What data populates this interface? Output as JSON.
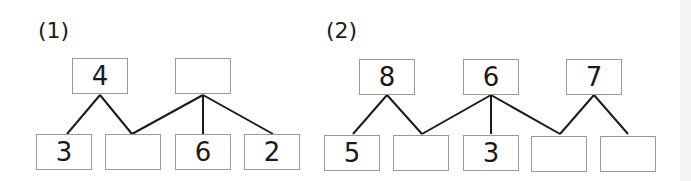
{
  "problems": [
    {
      "label": "(1)",
      "top": [
        "4",
        ""
      ],
      "bottom": [
        "3",
        "",
        "6",
        "2"
      ]
    },
    {
      "label": "(2)",
      "top": [
        "8",
        "6",
        "7"
      ],
      "bottom": [
        "5",
        "",
        "3",
        "",
        ""
      ]
    }
  ],
  "colors": {
    "box_border": "#9a9a9a",
    "line": "#1a1a1a",
    "text": "#1a1a1a"
  }
}
